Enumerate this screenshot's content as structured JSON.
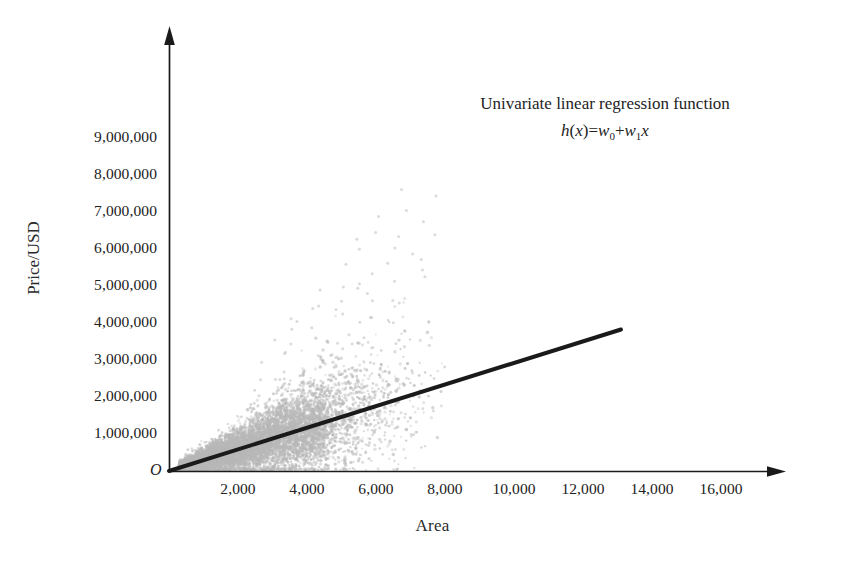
{
  "chart_data": {
    "type": "scatter",
    "title": "",
    "xlabel": "Area",
    "ylabel": "Price/USD",
    "xlim": [
      0,
      17500
    ],
    "ylim": [
      0,
      9600000
    ],
    "grid": false,
    "legend": null,
    "x_ticks": [
      "2,000",
      "4,000",
      "6,000",
      "8,000",
      "10,000",
      "12,000",
      "14,000",
      "16,000"
    ],
    "x_tick_values": [
      2000,
      4000,
      6000,
      8000,
      10000,
      12000,
      14000,
      16000
    ],
    "y_ticks": [
      "1,000,000",
      "2,000,000",
      "3,000,000",
      "4,000,000",
      "5,000,000",
      "6,000,000",
      "7,000,000",
      "8,000,000",
      "9,000,000"
    ],
    "y_tick_values": [
      1000000,
      2000000,
      3000000,
      4000000,
      5000000,
      6000000,
      7000000,
      8000000,
      9000000
    ],
    "origin_label": "O",
    "annotation": {
      "line1": "Univariate linear regression function",
      "formula_h": "h",
      "formula_open": "(",
      "formula_x1": "x",
      "formula_close": ")",
      "formula_eq": "=",
      "formula_w0": "w",
      "formula_sub0": "0",
      "formula_plus": "+",
      "formula_w1": "w",
      "formula_sub1": "1",
      "formula_x2": "x"
    },
    "series": [
      {
        "name": "Housing observations",
        "type": "scatter",
        "marker": "dot",
        "color": "#b8b8b8",
        "n_points_approx": 9000,
        "description": "Dense gray point cloud fanning upward from the origin; density highest for Area below 5,000 with a long sparse tail of outliers extending to Area near 8,000 and Price near 5,500,000.",
        "x_range": [
          150,
          8200
        ],
        "y_range": [
          20000,
          5600000
        ]
      },
      {
        "name": "Regression line",
        "type": "line",
        "color": "#1a1a1a",
        "line_width": 4,
        "intercept": 0,
        "slope": 292,
        "x_start": 0,
        "y_start": 0,
        "x_end": 13100,
        "y_end": 3825000
      }
    ]
  },
  "axes": {
    "x_axis_name": "Area",
    "y_axis_name": "Price/USD",
    "arrow_style": "solid-filled-triangle",
    "axis_color": "#1a1a1a"
  },
  "colors": {
    "background": "#ffffff",
    "axis": "#1a1a1a",
    "scatter": "#b8b8b8",
    "regression_line": "#1a1a1a",
    "text": "#222222"
  }
}
